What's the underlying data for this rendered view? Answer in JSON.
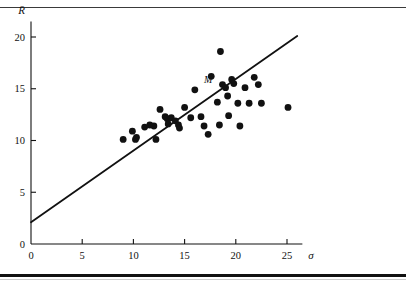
{
  "figure": {
    "background": "#ffffff",
    "ink": "#111111",
    "top_rule_color": "#3a3a3a",
    "bottom_rule_color": "#111111"
  },
  "chart_data": {
    "type": "scatter",
    "title": "",
    "xlabel": "σ",
    "ylabel": "R̄",
    "xlim": [
      0,
      26.5
    ],
    "ylim": [
      0,
      21.5
    ],
    "xticks": [
      0,
      5,
      10,
      15,
      20,
      25
    ],
    "xtick_labels": [
      "0",
      "5",
      "10",
      "15",
      "20",
      "25"
    ],
    "yticks": [
      0,
      5,
      10,
      15,
      20
    ],
    "ytick_labels": [
      "0",
      "5",
      "10",
      "15",
      "20"
    ],
    "grid": false,
    "legend": null,
    "marker": "filled-circle",
    "marker_color": "#111111",
    "marker_size_px": 4.6,
    "points": [
      {
        "x": 9.0,
        "y": 10.1
      },
      {
        "x": 9.9,
        "y": 10.9
      },
      {
        "x": 10.2,
        "y": 10.1
      },
      {
        "x": 10.3,
        "y": 10.3
      },
      {
        "x": 11.1,
        "y": 11.3
      },
      {
        "x": 11.6,
        "y": 11.5
      },
      {
        "x": 12.0,
        "y": 11.4
      },
      {
        "x": 12.2,
        "y": 10.1
      },
      {
        "x": 12.6,
        "y": 13.0
      },
      {
        "x": 13.1,
        "y": 12.3
      },
      {
        "x": 13.3,
        "y": 12.1
      },
      {
        "x": 13.4,
        "y": 11.6
      },
      {
        "x": 13.7,
        "y": 12.2
      },
      {
        "x": 14.1,
        "y": 11.9
      },
      {
        "x": 14.4,
        "y": 11.5
      },
      {
        "x": 14.5,
        "y": 11.2
      },
      {
        "x": 15.0,
        "y": 13.2
      },
      {
        "x": 15.6,
        "y": 12.2
      },
      {
        "x": 16.0,
        "y": 14.9
      },
      {
        "x": 16.6,
        "y": 12.3
      },
      {
        "x": 16.9,
        "y": 11.4
      },
      {
        "x": 17.3,
        "y": 10.6
      },
      {
        "x": 17.6,
        "y": 16.2
      },
      {
        "x": 18.2,
        "y": 13.7
      },
      {
        "x": 18.4,
        "y": 11.5
      },
      {
        "x": 18.5,
        "y": 18.6
      },
      {
        "x": 18.7,
        "y": 15.4
      },
      {
        "x": 19.0,
        "y": 15.1
      },
      {
        "x": 19.2,
        "y": 14.3
      },
      {
        "x": 19.3,
        "y": 12.4
      },
      {
        "x": 19.6,
        "y": 15.9
      },
      {
        "x": 19.8,
        "y": 15.5
      },
      {
        "x": 20.2,
        "y": 13.6
      },
      {
        "x": 20.4,
        "y": 11.4
      },
      {
        "x": 20.9,
        "y": 15.1
      },
      {
        "x": 21.3,
        "y": 13.6
      },
      {
        "x": 21.8,
        "y": 16.1
      },
      {
        "x": 22.2,
        "y": 15.4
      },
      {
        "x": 22.5,
        "y": 13.6
      },
      {
        "x": 25.1,
        "y": 13.2
      }
    ],
    "annotations": [
      {
        "label": "M",
        "x": 18.3,
        "y": 15.9,
        "anchor": "left-of-point"
      }
    ],
    "fit_line": {
      "kind": "straight-line",
      "x0": 0.0,
      "y0": 2.1,
      "x1": 26.0,
      "y1": 20.1,
      "color": "#111111",
      "width_px": 1.8
    }
  }
}
